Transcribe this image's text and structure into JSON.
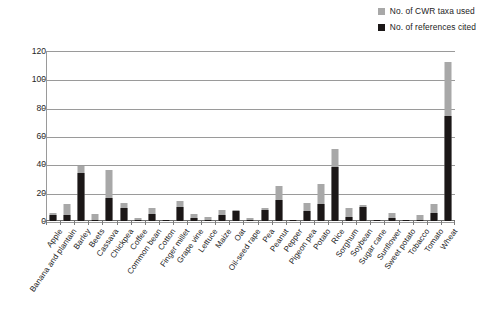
{
  "chart_data": {
    "type": "bar",
    "stacked": true,
    "title": "",
    "subtitle": "",
    "xlabel": "",
    "ylabel": "",
    "ylim": [
      0,
      120
    ],
    "yticks": [
      0,
      20,
      40,
      60,
      80,
      100,
      120
    ],
    "grid": "horizontal",
    "legend_position": "top-right",
    "legend": [
      {
        "name": "No. of CWR taxa used",
        "color": "#a8a8a8"
      },
      {
        "name": "No. of references cited",
        "color": "#1b1717"
      }
    ],
    "categories": [
      "Apple",
      "Banana and plantain",
      "Barley",
      "Beets",
      "Cassava",
      "Chickpea",
      "Coffee",
      "Common bean",
      "Cotton",
      "Finger millet",
      "Grape vine",
      "Lettuce",
      "Maize",
      "Oat",
      "Oil-seed rape",
      "Pea",
      "Peanut",
      "Pepper",
      "Pigeon pea",
      "Potato",
      "Rice",
      "Sorghum",
      "Soybean",
      "Sugar cane",
      "Sunflower",
      "Sweet potato",
      "Tobacco",
      "Tomato",
      "Wheat"
    ],
    "series": [
      {
        "name": "No. of references cited",
        "color": "#1b1717",
        "values": [
          4,
          4,
          34,
          1,
          16,
          9,
          1,
          5,
          1,
          10,
          2,
          1,
          4,
          7,
          1,
          8,
          15,
          1,
          7,
          12,
          38,
          3,
          10,
          1,
          2,
          1,
          1,
          6,
          74
        ]
      },
      {
        "name": "No. of CWR taxa used",
        "color": "#a8a8a8",
        "values": [
          6,
          12,
          39,
          5,
          36,
          13,
          2,
          9,
          1,
          14,
          5,
          3,
          8,
          8,
          2,
          9,
          25,
          1,
          13,
          26,
          51,
          9,
          11,
          1,
          6,
          1,
          4,
          12,
          112
        ],
        "note": "grey segment is drawn as the full bar total; black segment overlays from the baseline"
      }
    ]
  }
}
